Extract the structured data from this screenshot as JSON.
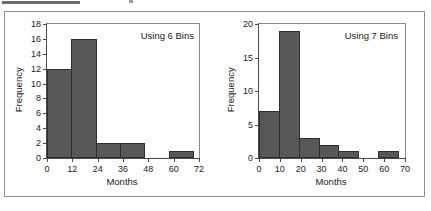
{
  "figure": {
    "background_color": "#ffffff",
    "border_color": "#8f8f8f",
    "bar_fill_color": "#585858",
    "bar_edge_color": "#2e2e2e",
    "axis_color": "#4a4a4a"
  },
  "chart_data": [
    {
      "type": "bar",
      "title": "",
      "annotation": "Using 6 Bins",
      "xlabel": "Months",
      "ylabel": "Frequency",
      "categories": [
        "0-12",
        "12-24",
        "24-36",
        "36-48",
        "48-60",
        "60-72"
      ],
      "bin_edges": [
        0,
        12,
        24,
        36,
        48,
        60,
        72
      ],
      "values": [
        12,
        16,
        2,
        2,
        0,
        1
      ],
      "xlim": [
        0,
        72
      ],
      "ylim": [
        0,
        18
      ],
      "xticks": [
        0,
        12,
        24,
        36,
        48,
        60,
        72
      ],
      "yticks": [
        0,
        2,
        4,
        6,
        8,
        10,
        12,
        14,
        16,
        18
      ],
      "grid": false,
      "legend": false
    },
    {
      "type": "bar",
      "title": "",
      "annotation": "Using 7 Bins",
      "xlabel": "Months",
      "ylabel": "Frequency",
      "categories": [
        "0-10",
        "10-20",
        "20-30",
        "30-40",
        "40-50",
        "50-60",
        "60-70"
      ],
      "bin_edges": [
        0,
        10,
        20,
        30,
        40,
        50,
        60,
        70
      ],
      "values": [
        7,
        19,
        3,
        2,
        1,
        0,
        1
      ],
      "xlim": [
        0,
        70
      ],
      "ylim": [
        0,
        20
      ],
      "xticks": [
        0,
        10,
        20,
        30,
        40,
        50,
        60,
        70
      ],
      "yticks": [
        0,
        5,
        10,
        15,
        20
      ],
      "grid": false,
      "legend": false
    }
  ]
}
